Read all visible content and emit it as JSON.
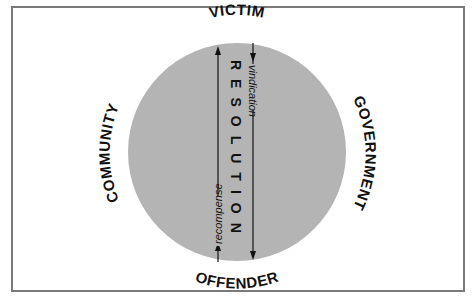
{
  "diagram": {
    "center_label": "RESOLUTION",
    "top_label": "VICTIM",
    "bottom_label": "OFFENDER",
    "left_label": "COMMUNITY",
    "right_label": "GOVERNMENT",
    "down_arrow_label": "vindication",
    "up_arrow_label": "recompense",
    "colors": {
      "circle_fill": "#b4b4b4",
      "border": "#7a7a7a",
      "text": "#111111"
    }
  }
}
